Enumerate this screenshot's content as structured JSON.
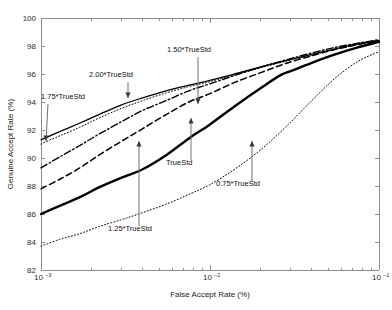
{
  "figure": {
    "background": "#ffffff",
    "plot_border_color": "#8d8d8d"
  },
  "chart_data": {
    "type": "line",
    "title": "",
    "xlabel": "False Accept Rate (%)",
    "ylabel": "Genuine Accept Rate (%)",
    "x_scale": "log",
    "y_scale": "linear",
    "xlim": [
      0.001,
      0.1
    ],
    "ylim": [
      82,
      100
    ],
    "grid": false,
    "legend_position": "none-inline-annotations",
    "x_tick_labels": [
      "10⁻³",
      "10⁻²",
      "10⁻¹"
    ],
    "x_tick_values": [
      0.001,
      0.01,
      0.1
    ],
    "y_tick_labels": [
      "82",
      "84",
      "86",
      "88",
      "90",
      "92",
      "94",
      "96",
      "98",
      "100"
    ],
    "y_tick_values": [
      82,
      84,
      86,
      88,
      90,
      92,
      94,
      96,
      98,
      100
    ],
    "series": [
      {
        "name": "2.00*TrueStd",
        "style": "solid-thin",
        "color": "#000000",
        "x": [
          0.001,
          0.0013,
          0.0017,
          0.0022,
          0.003,
          0.004,
          0.0055,
          0.0075,
          0.01,
          0.014,
          0.02,
          0.028,
          0.04,
          0.055,
          0.075,
          0.1
        ],
        "y": [
          91.3,
          91.9,
          92.5,
          93.1,
          93.8,
          94.3,
          94.8,
          95.2,
          95.55,
          96.0,
          96.5,
          96.95,
          97.4,
          97.8,
          98.15,
          98.4
        ]
      },
      {
        "name": "1.75*TrueStd",
        "style": "dotted-fine",
        "color": "#8a8a8a",
        "x": [
          0.001,
          0.0013,
          0.0017,
          0.0022,
          0.003,
          0.004,
          0.0055,
          0.0075,
          0.01,
          0.014,
          0.02,
          0.028,
          0.04,
          0.055,
          0.075,
          0.1
        ],
        "y": [
          91.0,
          91.6,
          92.2,
          92.85,
          93.55,
          94.1,
          94.65,
          95.1,
          95.45,
          95.95,
          96.45,
          96.9,
          97.35,
          97.75,
          98.1,
          98.35
        ]
      },
      {
        "name": "1.50*TrueStd",
        "style": "dash-dot",
        "color": "#000000",
        "x": [
          0.001,
          0.0013,
          0.0017,
          0.0022,
          0.003,
          0.004,
          0.0055,
          0.0075,
          0.01,
          0.014,
          0.02,
          0.028,
          0.04,
          0.055,
          0.075,
          0.1
        ],
        "y": [
          89.3,
          90.1,
          90.9,
          91.7,
          92.6,
          93.4,
          94.1,
          94.8,
          95.3,
          95.9,
          96.5,
          97.0,
          97.5,
          97.9,
          98.2,
          98.45
        ]
      },
      {
        "name": "1.25*TrueStd",
        "style": "dashed",
        "color": "#000000",
        "x": [
          0.001,
          0.0013,
          0.0017,
          0.0022,
          0.003,
          0.004,
          0.0055,
          0.0075,
          0.01,
          0.014,
          0.02,
          0.028,
          0.04,
          0.055,
          0.075,
          0.1
        ],
        "y": [
          87.8,
          88.5,
          89.3,
          90.2,
          91.2,
          92.1,
          93.1,
          94.0,
          94.6,
          95.4,
          96.1,
          96.75,
          97.3,
          97.75,
          98.1,
          98.35
        ]
      },
      {
        "name": "TrueStd",
        "style": "solid-thick",
        "color": "#000000",
        "x": [
          0.001,
          0.0013,
          0.0017,
          0.0022,
          0.003,
          0.004,
          0.0055,
          0.0075,
          0.01,
          0.014,
          0.02,
          0.026,
          0.03,
          0.04,
          0.055,
          0.075,
          0.1
        ],
        "y": [
          86.0,
          86.6,
          87.2,
          87.9,
          88.6,
          89.2,
          90.2,
          91.4,
          92.4,
          93.7,
          95.0,
          95.9,
          96.2,
          96.8,
          97.4,
          97.9,
          98.3
        ]
      },
      {
        "name": "0.75*TrueStd",
        "style": "dotted-fine",
        "color": "#9a9a9a",
        "x": [
          0.001,
          0.0013,
          0.0017,
          0.0022,
          0.003,
          0.004,
          0.0055,
          0.0075,
          0.01,
          0.014,
          0.02,
          0.028,
          0.04,
          0.055,
          0.075,
          0.1
        ],
        "y": [
          83.7,
          84.2,
          84.6,
          85.1,
          85.6,
          86.1,
          86.7,
          87.4,
          88.1,
          89.2,
          90.6,
          92.2,
          94.1,
          95.7,
          96.9,
          97.6
        ]
      }
    ],
    "annotations": [
      {
        "label": "1.75*TrueStd",
        "label_x_px": 41,
        "label_y_px": 99,
        "anchor": "start",
        "arrow_from_px": [
          48,
          104
        ],
        "arrow_to_px": [
          46,
          141
        ],
        "direction": "down"
      },
      {
        "label": "2.00*TrueStd",
        "label_x_px": 89,
        "label_y_px": 77,
        "anchor": "start",
        "arrow_from_px": [
          128,
          82
        ],
        "arrow_to_px": [
          128,
          98
        ],
        "direction": "up"
      },
      {
        "label": "1.50*TrueStd",
        "label_x_px": 167,
        "label_y_px": 52,
        "anchor": "start",
        "arrow_from_px": [
          198,
          57
        ],
        "arrow_to_px": [
          198,
          104
        ],
        "direction": "down"
      },
      {
        "label": "1.25*TrueStd",
        "label_x_px": 108,
        "label_y_px": 231,
        "anchor": "start",
        "arrow_from_px": [
          139,
          226
        ],
        "arrow_to_px": [
          139,
          141
        ],
        "direction": "up"
      },
      {
        "label": "TrueStd",
        "label_x_px": 166,
        "label_y_px": 165,
        "anchor": "start",
        "arrow_from_px": [
          191,
          160
        ],
        "arrow_to_px": [
          191,
          118
        ],
        "direction": "up"
      },
      {
        "label": "0.75*TrueStd",
        "label_x_px": 216,
        "label_y_px": 186,
        "anchor": "start",
        "arrow_from_px": [
          252,
          181
        ],
        "arrow_to_px": [
          252,
          141
        ],
        "direction": "up"
      }
    ]
  }
}
